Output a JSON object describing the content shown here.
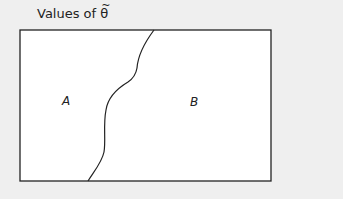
{
  "title": {
    "prefix": "Values of ",
    "symbol": "θ",
    "accent": "~"
  },
  "regions": [
    {
      "label": "A"
    },
    {
      "label": "B"
    }
  ],
  "colors": {
    "background": "#efefef",
    "box_fill": "#ffffff",
    "stroke": "#222222"
  }
}
